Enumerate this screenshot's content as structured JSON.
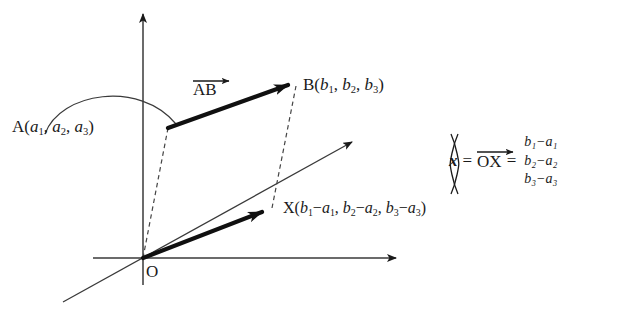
{
  "figure": {
    "background_color": "#ffffff",
    "stroke_color": "#1a1a1a"
  },
  "axes": {
    "origin_label": "O",
    "vertical_axis_name": "vertical-axis",
    "horizontal_axis_name": "horizontal-axis",
    "depth_axis_name": "depth-axis"
  },
  "points": {
    "A": {
      "name": "A",
      "label": "A(a₁, a₂, a₃)",
      "coords": [
        "a₁",
        "a₂",
        "a₃"
      ]
    },
    "B": {
      "name": "B",
      "label": "B(b₁, b₂, b₃)",
      "coords": [
        "b₁",
        "b₂",
        "b₃"
      ]
    },
    "X": {
      "name": "X",
      "label": "X(b₁−a₁, b₂−a₂, b₃−a₃)",
      "coords": [
        "b₁−a₁",
        "b₂−a₂",
        "b₃−a₃"
      ]
    },
    "O": {
      "name": "O",
      "label": "O"
    }
  },
  "vectors": {
    "AB": {
      "label": "AB",
      "style": "bold-arrow",
      "from": "A",
      "to": "B"
    },
    "OX": {
      "label": "OX",
      "style": "bold-arrow",
      "from": "O",
      "to": "X"
    }
  },
  "equation": {
    "lhs": "x",
    "equals_1": "=",
    "vector_name": "OX",
    "equals_2": "=",
    "matrix_rows": [
      "b₁−a₁",
      "b₂−a₂",
      "b₃−a₃"
    ]
  },
  "construction": {
    "dashed_line_1": "O-to-A dashed guide",
    "dashed_line_2": "X-to-B dashed guide",
    "leader_arc": "arc from label A to point A"
  }
}
